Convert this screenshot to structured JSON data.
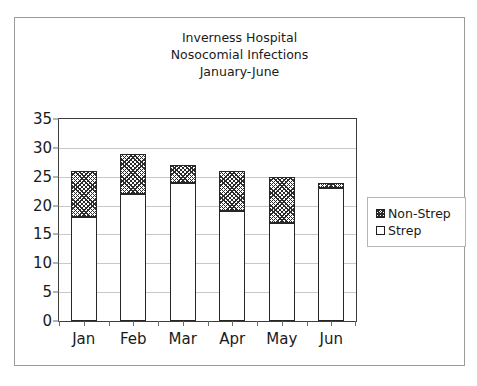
{
  "chart_data": {
    "type": "bar",
    "subtype": "stacked-vertical",
    "title": "Inverness Hospital Nosocomial Infections January-June",
    "title_lines": [
      "Inverness Hospital",
      "Nosocomial Infections",
      "January-June"
    ],
    "categories": [
      "Jan",
      "Feb",
      "Mar",
      "Apr",
      "May",
      "Jun"
    ],
    "series": [
      {
        "name": "Strep",
        "values": [
          18,
          22,
          24,
          19,
          17,
          23
        ],
        "fill": "white",
        "border": "#262626"
      },
      {
        "name": "Non-Strep",
        "values": [
          8,
          7,
          3,
          7,
          8,
          1
        ],
        "fill": "diagonal-hatch",
        "border": "#262626"
      }
    ],
    "totals": [
      26,
      29,
      27,
      26,
      25,
      24
    ],
    "xlabel": "",
    "ylabel": "",
    "ylim": [
      0,
      35
    ],
    "ytick_values": [
      0,
      5,
      10,
      15,
      20,
      25,
      30,
      35
    ],
    "ytick_labels": [
      "0",
      "5",
      "10",
      "15",
      "20",
      "25",
      "30",
      "35"
    ],
    "grid": "horizontal",
    "legend_position": "right",
    "legend_entries": [
      "Non-Strep",
      "Strep"
    ],
    "colors": {
      "plot_border": "#3d3d3d",
      "gridline": "#c8c8c8",
      "frame_border": "#9a9a9a",
      "bar_outline": "#262626",
      "hatch": "#2b2b2b",
      "text": "#1a1a1a"
    }
  }
}
